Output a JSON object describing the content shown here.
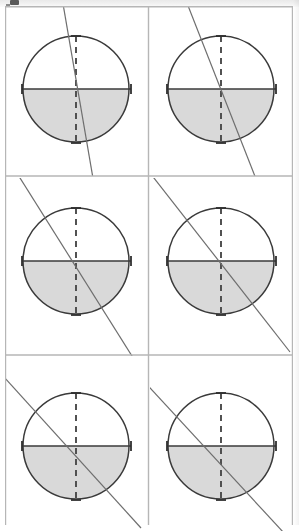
{
  "figure": {
    "kind": "geometry-diagram-grid",
    "grid": {
      "columns": 2,
      "rows": 3,
      "panel_count": 6
    },
    "colors": {
      "page_background": "#ffffff",
      "rule_line": "#b6b6b6",
      "circle_outline": "#3a3a3a",
      "axis_line": "#3a3a3a",
      "dashed_axis": "#4a4a4a",
      "shaded_half": "#d9d9d9",
      "secant_line": "#6e6e6e",
      "scan_band": "#ececec"
    },
    "panels": [
      {
        "id": "panel-1",
        "label": "panel-row1-col1",
        "row": 1,
        "column": 1,
        "circle": {
          "cx": 71,
          "cy": 83,
          "r": 53
        },
        "horizontal_axis": {
          "style": "solid",
          "x1": 17,
          "x2": 126,
          "y": 83
        },
        "vertical_axis": {
          "style": "dashed",
          "x": 71,
          "y1": 30,
          "y2": 137
        },
        "shaded_region": "lower-semicircle",
        "ticks": [
          "top",
          "bottom",
          "left",
          "right"
        ],
        "secant_line": {
          "angle_deg_from_vertical": 9,
          "x1": 57,
          "y1": -8,
          "x2": 89,
          "y2": 178
        }
      },
      {
        "id": "panel-2",
        "label": "panel-row1-col2",
        "row": 2,
        "column": 2,
        "circle": {
          "cx": 71,
          "cy": 83,
          "r": 53
        },
        "horizontal_axis": {
          "style": "solid",
          "x1": 17,
          "x2": 126,
          "y": 83
        },
        "vertical_axis": {
          "style": "dashed",
          "x": 71,
          "y1": 30,
          "y2": 137
        },
        "shaded_region": "lower-semicircle",
        "ticks": [
          "top",
          "bottom",
          "left",
          "right"
        ],
        "secant_line": {
          "angle_deg_from_vertical": 22,
          "x1": 35,
          "y1": -8,
          "x2": 108,
          "y2": 178
        }
      },
      {
        "id": "panel-3",
        "label": "panel-row2-col1",
        "row": 2,
        "column": 1,
        "circle": {
          "cx": 71,
          "cy": 83,
          "r": 53
        },
        "horizontal_axis": {
          "style": "solid",
          "x1": 17,
          "x2": 126,
          "y": 83
        },
        "vertical_axis": {
          "style": "dashed",
          "x": 71,
          "y1": 30,
          "y2": 137
        },
        "shaded_region": "lower-semicircle",
        "ticks": [
          "top",
          "bottom",
          "left",
          "right"
        ],
        "secant_line": {
          "angle_deg_from_vertical": 33,
          "x1": 10,
          "y1": -8,
          "x2": 132,
          "y2": 178
        }
      },
      {
        "id": "panel-4",
        "label": "panel-row2-col2",
        "row": 2,
        "column": 2,
        "circle": {
          "cx": 71,
          "cy": 83,
          "r": 53
        },
        "horizontal_axis": {
          "style": "solid",
          "x1": 17,
          "x2": 126,
          "y": 83
        },
        "vertical_axis": {
          "style": "dashed",
          "x": 71,
          "y1": 30,
          "y2": 137
        },
        "shaded_region": "lower-semicircle",
        "ticks": [
          "top",
          "bottom",
          "left",
          "right"
        ],
        "secant_line": {
          "angle_deg_from_vertical": 40,
          "x1": -7,
          "y1": -14,
          "x2": 131,
          "y2": 163
        }
      },
      {
        "id": "panel-5",
        "label": "panel-row3-col1",
        "row": 3,
        "column": 1,
        "circle": {
          "cx": 71,
          "cy": 83,
          "r": 53
        },
        "horizontal_axis": {
          "style": "solid",
          "x1": 17,
          "x2": 126,
          "y": 83
        },
        "vertical_axis": {
          "style": "dashed",
          "x": 71,
          "y1": 30,
          "y2": 137
        },
        "shaded_region": "lower-semicircle",
        "ticks": [
          "top",
          "bottom",
          "left",
          "right"
        ],
        "secant_line": {
          "angle_deg_from_vertical": 48,
          "x1": -12,
          "y1": -10,
          "x2": 130,
          "y2": 148
        }
      },
      {
        "id": "panel-6",
        "label": "panel-row3-col2",
        "row": 3,
        "column": 2,
        "circle": {
          "cx": 71,
          "cy": 83,
          "r": 53
        },
        "horizontal_axis": {
          "style": "solid",
          "x1": 17,
          "x2": 126,
          "y": 83
        },
        "vertical_axis": {
          "style": "dashed",
          "x": 71,
          "y1": 30,
          "y2": 137
        },
        "shaded_region": "lower-semicircle",
        "ticks": [
          "top",
          "bottom",
          "left",
          "right"
        ],
        "secant_line": {
          "angle_deg_from_vertical": 52,
          "x1": -18,
          "y1": -3,
          "x2": 126,
          "y2": 141
        }
      }
    ]
  }
}
